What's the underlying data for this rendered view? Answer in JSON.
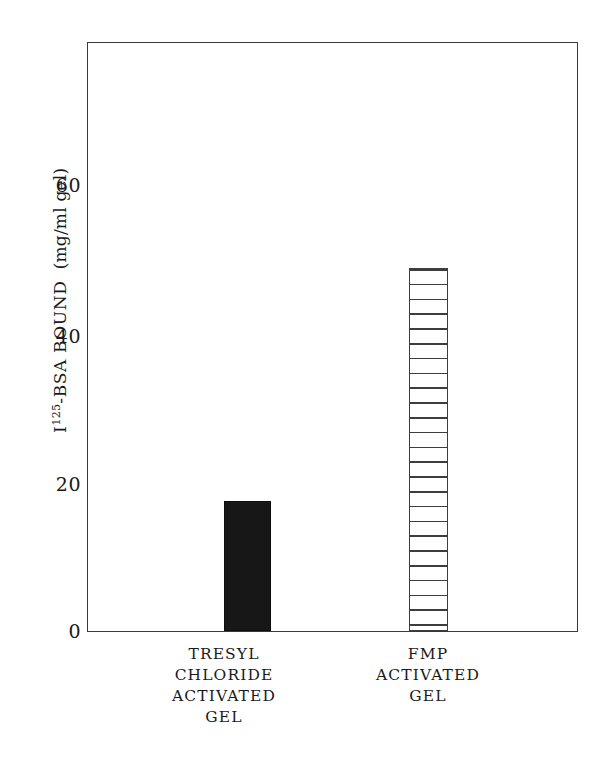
{
  "chart_data": {
    "type": "bar",
    "title": "",
    "subtitle": "",
    "xlabel": "",
    "ylabel": "I125-BSA BOUND (mg/ml gel)",
    "ylabel_parts": {
      "base": "I",
      "superscript": "125",
      "rest": "-BSA BOUND",
      "units": "(mg/ml gel)"
    },
    "categories": [
      "TRESYL CHLORIDE ACTIVATED GEL",
      "FMP ACTIVATED GEL"
    ],
    "category_lines": [
      [
        "TRESYL",
        "CHLORIDE",
        "ACTIVATED",
        "GEL"
      ],
      [
        "FMP",
        "ACTIVATED",
        "GEL"
      ]
    ],
    "values": [
      17.5,
      48.8
    ],
    "ylim": [
      0,
      79
    ],
    "yticks": [
      0,
      20,
      40,
      60
    ],
    "ytick_labels": [
      "0",
      "20",
      "40",
      "60"
    ],
    "xticks": [],
    "grid": false,
    "legend": false,
    "legend_position": "none",
    "bar_styles": [
      "solid-black",
      "horizontal-stripes"
    ],
    "colors": {
      "axis": "#3a3a3a",
      "bar_solid": "#171717",
      "bar_stripe": "#3d3d3d",
      "background": "#ffffff",
      "text": "#1a1a1a"
    }
  },
  "axis": {
    "tick_0": "0",
    "tick_20": "20",
    "tick_40": "40",
    "tick_60": "60"
  },
  "bars": {
    "bar1": {
      "label_line1": "TRESYL",
      "label_line2": "CHLORIDE",
      "label_line3": "ACTIVATED",
      "label_line4": "GEL",
      "value": 17.5
    },
    "bar2": {
      "label_line1": "FMP",
      "label_line2": "ACTIVATED",
      "label_line3": "GEL",
      "value": 48.8
    }
  },
  "ylabel": {
    "base": "I",
    "superscript": "125",
    "rest": "-BSA BOUND",
    "units": "(mg/ml gel)"
  }
}
